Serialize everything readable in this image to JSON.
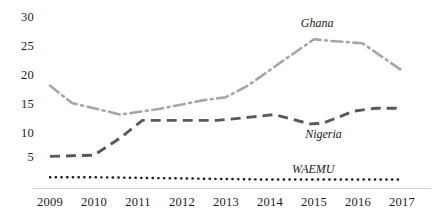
{
  "chart_data": {
    "type": "line",
    "title": "",
    "xlabel": "",
    "ylabel": "",
    "categories": [
      2009,
      2010,
      2011,
      2012,
      2013,
      2014,
      2015,
      2016,
      2017
    ],
    "xtick_labels": [
      "2009",
      "2010",
      "2011",
      "2012",
      "2013",
      "2014",
      "2015",
      "2016",
      "2017"
    ],
    "ytick_labels": [
      "30",
      "25",
      "20",
      "15",
      "10",
      "5"
    ],
    "ytick_values": [
      30,
      25,
      20,
      15,
      10,
      5
    ],
    "ylim": [
      0,
      31
    ],
    "xlim": [
      2009,
      2017
    ],
    "grid": false,
    "legend_position": "inline-labels",
    "series": [
      {
        "name": "Ghana",
        "color": "#a6a6a6",
        "style": "dash-dot",
        "values": [
          18.0,
          15.0,
          13.0,
          14.0,
          15.5,
          16.0,
          18.0,
          22.3,
          26.0,
          25.7,
          25.3,
          20.6
        ],
        "x": [
          2009,
          2009.5,
          2010.6,
          2011.5,
          2012.5,
          2013.0,
          2013.5,
          2014.3,
          2015.0,
          2015.4,
          2016.1,
          2017.0
        ],
        "label_text": "Ghana"
      },
      {
        "name": "Nigeria",
        "color": "#595959",
        "style": "dashed",
        "values": [
          5.8,
          5.9,
          6.0,
          9.0,
          12.0,
          12.0,
          12.0,
          12.0,
          12.6,
          13.0,
          11.4,
          11.5,
          13.6,
          14.1,
          14.1
        ],
        "x": [
          2009,
          2009.5,
          2010.0,
          2010.6,
          2011.1,
          2011.6,
          2012.2,
          2012.8,
          2013.6,
          2014.1,
          2014.9,
          2015.2,
          2015.9,
          2016.4,
          2017.0
        ],
        "label_text": "Nigeria"
      },
      {
        "name": "WAEMU",
        "color": "#1a1a1a",
        "style": "dotted",
        "values": [
          2.2,
          2.2,
          2.1,
          2.0,
          1.9,
          1.8,
          1.8,
          1.8,
          1.8
        ],
        "x": [
          2009,
          2010,
          2011,
          2012,
          2013,
          2014,
          2015,
          2016,
          2017
        ],
        "label_text": "WAEMU"
      }
    ],
    "annotations": [
      {
        "text": "Ghana",
        "x": 2014.7,
        "y": 28.8
      },
      {
        "text": "Nigeria",
        "x": 2014.8,
        "y": 9.7
      },
      {
        "text": "WAEMU",
        "x": 2014.5,
        "y": 3.6
      }
    ]
  },
  "colors": {
    "ghana": "#a6a6a6",
    "nigeria": "#595959",
    "waemu": "#1a1a1a",
    "axis": "#cfcfcf",
    "text": "#1a1a1a",
    "background": "#ffffff"
  }
}
